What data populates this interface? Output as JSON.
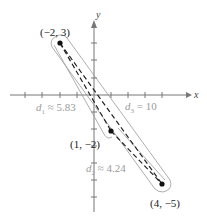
{
  "diagram": {
    "axes": {
      "x_label": "x",
      "y_label": "y"
    },
    "points": [
      {
        "label": "(−2, 3)",
        "x": -2,
        "y": 3
      },
      {
        "label": "(1, −2)",
        "x": 1,
        "y": -2
      },
      {
        "label": "(4, −5)",
        "x": 4,
        "y": -5
      }
    ],
    "distances": [
      {
        "name": "d1",
        "symbol": "d",
        "sub": "1",
        "value_text": "≈ 5.83"
      },
      {
        "name": "d2",
        "symbol": "d",
        "sub": "2",
        "value_text": "≈ 4.24"
      },
      {
        "name": "d3",
        "symbol": "d",
        "sub": "3",
        "value_text": "= 10"
      }
    ],
    "colors": {
      "axis": "#777777",
      "segment": "#222222",
      "outline": "#999999",
      "distance_label": "#9a9a9a"
    }
  }
}
